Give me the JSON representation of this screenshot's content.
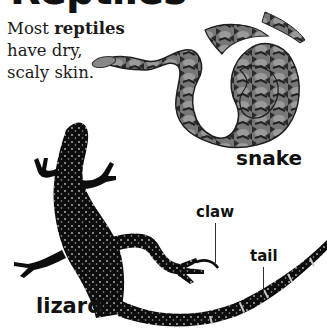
{
  "page": {
    "title": "Reptiles",
    "intro": {
      "prefix": "Most ",
      "bold": "reptiles",
      "line2": "have dry,",
      "line3": "scaly skin."
    }
  },
  "labels": {
    "snake": "snake",
    "lizard": "lizard",
    "claw": "claw",
    "tail": "tail"
  },
  "colors": {
    "text": "#111111",
    "background": "#ffffff",
    "snake_body": "#6f6f6f",
    "snake_pattern": "#2a2a2a",
    "lizard_body": "#0d0d0d",
    "lizard_spots": "#bdbdbd"
  }
}
